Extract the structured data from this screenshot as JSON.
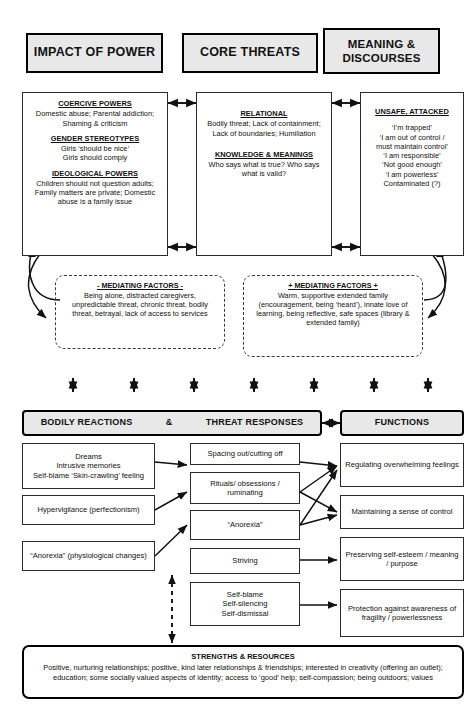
{
  "headers": {
    "impact_of_power": "IMPACT OF POWER",
    "core_threats": "CORE THREATS",
    "meaning_discourses": "MEANING &\nDISCOURSES",
    "meaning_line1": "MEANING &",
    "meaning_line2": "DISCOURSES"
  },
  "impact_of_power": {
    "coercive_title": "COERCIVE POWERS",
    "coercive_body": "Domestic abuse; Parental addiction; Shaming & criticism",
    "gender_title": "GENDER STEREOTYPES",
    "gender_body": "Girls ‘should be nice’\nGirls should comply",
    "gender_line1": "Girls ‘should be nice’",
    "gender_line2": "Girls should comply",
    "ideological_title": "IDEOLOGICAL POWERS",
    "ideological_body": "Children should not question adults; Family matters are private; Domestic abuse is a family issue"
  },
  "core_threats": {
    "relational_title": "RELATIONAL",
    "relational_body": "Bodily threat; Lack of containment; Lack of boundaries; Humiliation",
    "knowledge_title": "KNOWLEDGE & MEANINGS",
    "knowledge_body": "Who says what is true? Who says what is valid?"
  },
  "meaning_discourses": {
    "title": "UNSAFE, ATTACKED",
    "lines": [
      "‘I’m trapped’",
      "‘I am out of control /",
      "must maintain control’",
      "‘I am responsible’",
      "‘Not good enough’",
      "‘I am powerless’",
      "Contaminated (?)"
    ]
  },
  "mediating_negative": {
    "title": "- MEDIATING FACTORS -",
    "body": "Being alone, distracted caregivers, unpredictable threat, chronic threat, bodily threat, betrayal, lack of access to services"
  },
  "mediating_positive": {
    "title": "+ MEDIATING FACTORS +",
    "body": "Warm, supportive extended family (encouragement, being ‘heard’), innate love of learning, being reflective, safe spaces (library & extended family)"
  },
  "lower_headers": {
    "bodily_reactions": "BODILY REACTIONS",
    "ampersand": "&",
    "threat_responses": "THREAT RESPONSES",
    "functions": "FUNCTIONS"
  },
  "bodily_reactions": [
    "Dreams\nIntrusive memories\nSelf-blame ‘Skin-crawling’ feeling",
    "Hypervigilance (perfectionism)",
    "“Anorexia” (physiological changes)"
  ],
  "threat_responses": [
    "Spacing out/cutting off",
    "Rituals/ obsessions / ruminating",
    "“Anorexia”",
    "Striving",
    "Self-blame\nSelf-silencing\nSelf-dismissal"
  ],
  "functions": [
    "Regulating overwhelming feelings",
    "Maintaining a sense of control",
    "Preserving self-esteem / meaning / purpose",
    "Protection against awareness of fragility / powerlessness"
  ],
  "strengths": {
    "title": "STRENGTHS & RESOURCES",
    "body": "Positive, nurturing relationships; positive, kind later relationships & friendships; interested in creativity (offering an outlet); education; some socially valued aspects of identity; access to ‘good’ help; self-compassion; being outdoors; values"
  },
  "colors": {
    "header_fill": "#e8e8e8",
    "line": "#1a1a1a",
    "background": "#ffffff"
  }
}
